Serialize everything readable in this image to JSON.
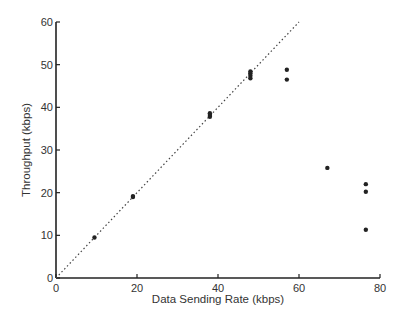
{
  "chart_data": {
    "type": "scatter",
    "title": "",
    "xlabel": "Data Sending Rate (kbps)",
    "ylabel": "Throughput (kbps)",
    "xlim": [
      0,
      80
    ],
    "ylim": [
      0,
      60
    ],
    "xticks": [
      0,
      20,
      40,
      60,
      80
    ],
    "yticks": [
      0,
      10,
      20,
      30,
      40,
      50,
      60
    ],
    "grid": false,
    "legend": null,
    "reference_line": {
      "style": "dotted",
      "from": [
        0,
        0
      ],
      "to": [
        80,
        80
      ],
      "label": "y = x"
    },
    "series": [
      {
        "name": "measurements",
        "points": [
          {
            "x": 9.5,
            "y": 9.5
          },
          {
            "x": 19,
            "y": 19
          },
          {
            "x": 19,
            "y": 19.2
          },
          {
            "x": 38,
            "y": 37.8
          },
          {
            "x": 38,
            "y": 38.2
          },
          {
            "x": 38,
            "y": 38.6
          },
          {
            "x": 48,
            "y": 46.8
          },
          {
            "x": 48,
            "y": 47.4
          },
          {
            "x": 48,
            "y": 48.0
          },
          {
            "x": 48,
            "y": 48.4
          },
          {
            "x": 57,
            "y": 48.8
          },
          {
            "x": 57,
            "y": 46.5
          },
          {
            "x": 67,
            "y": 25.8
          },
          {
            "x": 76.5,
            "y": 22.0
          },
          {
            "x": 76.5,
            "y": 20.2
          },
          {
            "x": 76.5,
            "y": 11.3
          }
        ]
      }
    ]
  },
  "labels": {
    "xlabel": "Data Sending Rate (kbps)",
    "ylabel": "Throughput (kbps)"
  }
}
